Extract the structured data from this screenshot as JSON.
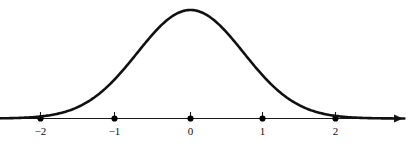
{
  "figure": {
    "name": "bell-curve-number-line",
    "background_color": "#ffffff",
    "width": 410,
    "height": 150
  },
  "chart_data": {
    "type": "line",
    "title": "",
    "subtitle": "",
    "xlabel": "",
    "ylabel": "",
    "grid": false,
    "legend": null,
    "annotations": [],
    "curve_name": "gaussian-bell-curve",
    "curve_color": "#111111",
    "axis_color": "#1a1a1a",
    "dot_color": "#000000",
    "xlim": [
      -2.9,
      2.9
    ],
    "ylim": [
      0,
      1.12
    ],
    "xticks": [
      -2,
      -1,
      0,
      1,
      2
    ],
    "xticklabels": [
      "−2",
      "−1",
      "0",
      "1",
      "2"
    ],
    "yticks": [],
    "yticklabels": [],
    "peak": {
      "x": 0,
      "y": 1
    },
    "mean": 0,
    "std_dev": 0.72,
    "x": [
      -2.9,
      -2.7,
      -2.5,
      -2.3,
      -2.1,
      -1.9,
      -1.7,
      -1.5,
      -1.3,
      -1.1,
      -0.9,
      -0.7,
      -0.5,
      -0.3,
      -0.1,
      0,
      0.1,
      0.3,
      0.5,
      0.7,
      0.9,
      1.1,
      1.3,
      1.5,
      1.7,
      1.9,
      2.1,
      2.3,
      2.5,
      2.7,
      2.9
    ],
    "y": [
      0.0,
      0.0,
      0.005,
      0.013,
      0.031,
      0.066,
      0.127,
      0.219,
      0.343,
      0.49,
      0.644,
      0.783,
      0.889,
      0.958,
      0.995,
      1.0,
      0.995,
      0.958,
      0.889,
      0.783,
      0.644,
      0.49,
      0.343,
      0.219,
      0.127,
      0.066,
      0.031,
      0.013,
      0.005,
      0.0,
      0.0
    ]
  },
  "axis": {
    "name": "x-axis",
    "has_right_arrow": true,
    "has_left_arrow": false,
    "ticks": [
      {
        "value": -2,
        "label": "−2",
        "has_dot": true,
        "has_tick_mark": true
      },
      {
        "value": -1,
        "label": "−1",
        "has_dot": true,
        "has_tick_mark": true
      },
      {
        "value": 0,
        "label": "0",
        "has_dot": true,
        "has_tick_mark": true
      },
      {
        "value": 1,
        "label": "1",
        "has_dot": true,
        "has_tick_mark": true
      },
      {
        "value": 2,
        "label": "2",
        "has_dot": true,
        "has_tick_mark": true
      }
    ]
  }
}
